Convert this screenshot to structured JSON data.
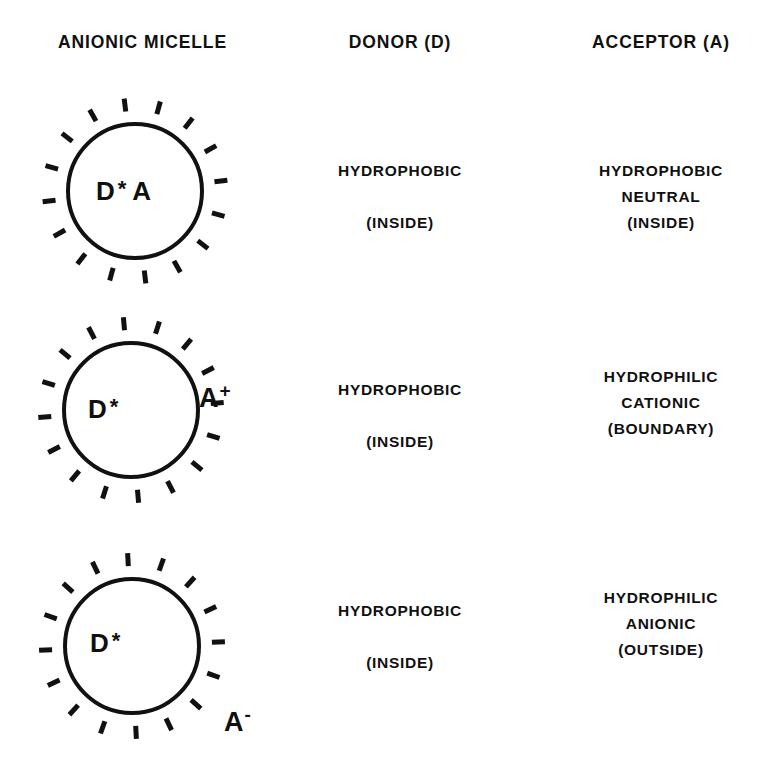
{
  "figure": {
    "background_color": "#ffffff",
    "ink_color": "#111111"
  },
  "headers": {
    "micelle": "ANIONIC MICELLE",
    "donor": "DONOR (D)",
    "acceptor": "ACCEPTOR (A)"
  },
  "rows": [
    {
      "id": "row-1",
      "micelle": {
        "surface_charge": "-",
        "dash_count": 16,
        "core_label": {
          "donor": "D",
          "excited_marker": "*",
          "acceptor": "A"
        },
        "acceptor_position": "inside"
      },
      "donor": {
        "line1": "HYDROPHOBIC",
        "line2": "",
        "line3": "(INSIDE)"
      },
      "acceptor": {
        "line1": "HYDROPHOBIC",
        "line2": "NEUTRAL",
        "line3": "(INSIDE)"
      }
    },
    {
      "id": "row-2",
      "micelle": {
        "surface_charge": "-",
        "dash_count": 16,
        "core_label": {
          "donor": "D",
          "excited_marker": "*",
          "acceptor": ""
        },
        "external_ion": {
          "symbol": "A",
          "charge": "+"
        },
        "acceptor_position": "boundary"
      },
      "donor": {
        "line1": "HYDROPHOBIC",
        "line2": "",
        "line3": "(INSIDE)"
      },
      "acceptor": {
        "line1": "HYDROPHILIC",
        "line2": "CATIONIC",
        "line3": "(BOUNDARY)"
      }
    },
    {
      "id": "row-3",
      "micelle": {
        "surface_charge": "-",
        "dash_count": 16,
        "core_label": {
          "donor": "D",
          "excited_marker": "*",
          "acceptor": ""
        },
        "external_ion": {
          "symbol": "A",
          "charge": "-"
        },
        "acceptor_position": "outside"
      },
      "donor": {
        "line1": "HYDROPHOBIC",
        "line2": "",
        "line3": "(INSIDE)"
      },
      "acceptor": {
        "line1": "HYDROPHILIC",
        "line2": "ANIONIC",
        "line3": "(OUTSIDE)"
      }
    }
  ]
}
